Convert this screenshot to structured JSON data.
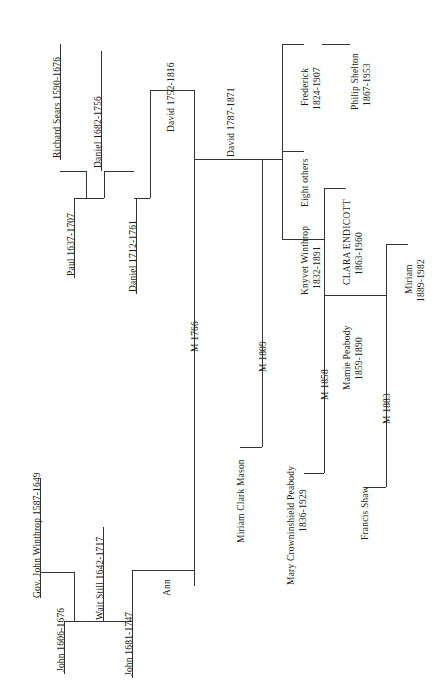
{
  "document": {
    "type": "genealogical-family-tree",
    "orientation": "rotated-90-counterclockwise",
    "title": "",
    "background_color": "#ffffff",
    "line_color": "#333333",
    "text_color": "#1c1c1c"
  },
  "nodes": {
    "richard_sears": {
      "name": "Richard Sears",
      "dates": "1590-1676",
      "label": "Richard Sears  1590-1676"
    },
    "paul_sears": {
      "name": "Paul",
      "dates": "1637-1707",
      "label": "Paul  1637-1707"
    },
    "daniel_sears_1682": {
      "name": "Daniel",
      "dates": "1682-1756",
      "label": "Daniel  1682-1756"
    },
    "daniel_sears_1712": {
      "name": "Daniel",
      "dates": "1712-1761",
      "label": "Daniel  1712-1761"
    },
    "david_sears_1752": {
      "name": "David",
      "dates": "1752-1816",
      "label": "David  1752-1816"
    },
    "david_sears_1787": {
      "name": "David",
      "dates": "1787-1871",
      "label": "David  1787-1871"
    },
    "frederick": {
      "name": "Frederick",
      "dates": "1824-1907",
      "line1": "Frederick",
      "line2": "1824-1907"
    },
    "philip_shelton": {
      "name": "Philip Shelton",
      "dates": "1867-1953",
      "line1": "Philip Shelton",
      "line2": "1867-1953"
    },
    "eight_others": {
      "label": "Eight others"
    },
    "knyvet_winthrop": {
      "name": "Knyvet Winthrop",
      "dates": "1832-1891",
      "line1": "Knyvet Winthrop",
      "line2": "1832-1891"
    },
    "clara_endicott": {
      "name": "CLARA ENDICOTT",
      "dates": "1863-1960",
      "line1": "CLARA ENDICOTT",
      "line2": "1863-1960"
    },
    "mamie_peabody": {
      "name": "Mamie Peabody",
      "dates": "1859-1890",
      "line1": "Mamie Peabody",
      "line2": "1859-1890"
    },
    "miriam_shaw": {
      "name": "Miriam",
      "dates": "1889-1982",
      "line1": "Miriam",
      "line2": "1889-1982"
    },
    "gov_john_winthrop": {
      "name": "Gov. John Winthrop",
      "dates": "1587-1649",
      "label": "Gov. John Winthrop  1587-1649"
    },
    "john_winthrop_1606": {
      "name": "John",
      "dates": "1606-1676",
      "label": "John  1606-1676"
    },
    "wait_still": {
      "name": "Wait Still",
      "dates": "1642-1717",
      "label": "Wait Still  1642-1717"
    },
    "john_winthrop_1681": {
      "name": "John",
      "dates": "1681-1747",
      "label": "John  1681-1747"
    },
    "ann": {
      "name": "Ann",
      "label": "Ann"
    },
    "miriam_clark_mason": {
      "name": "Miriam Clark Mason",
      "label": "Miriam Clark Mason"
    },
    "mary_crowninshield_peabody": {
      "name": "Mary Crowninshield Peabody",
      "dates": "1836-1929",
      "line1": "Mary Crowninshield Peabody",
      "line2": "1836-1929"
    },
    "francis_shaw": {
      "name": "Francis Shaw",
      "label": "Francis  Shaw"
    }
  },
  "marriages": [
    {
      "id": "m1766",
      "label": "M 1766",
      "spouses": [
        "Ann",
        "David 1752-1816"
      ]
    },
    {
      "id": "m1809",
      "label": "M 1809",
      "spouses": [
        "Miriam Clark Mason",
        "David 1787-1871"
      ]
    },
    {
      "id": "m1858",
      "label": "M 1858",
      "spouses": [
        "Mary Crowninshield Peabody",
        "Knyvet Winthrop"
      ]
    },
    {
      "id": "m1883",
      "label": "M 1883",
      "spouses": [
        "Francis Shaw",
        "Mamie Peabody"
      ]
    }
  ],
  "legend": {
    "note": ""
  }
}
